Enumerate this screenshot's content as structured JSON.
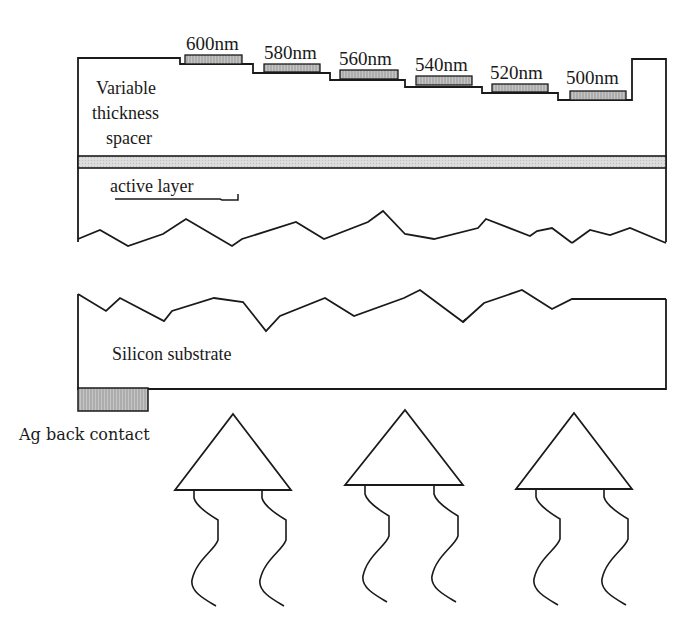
{
  "diagram": {
    "type": "device-cross-section",
    "filters": [
      {
        "label": "600nm"
      },
      {
        "label": "580nm"
      },
      {
        "label": "560nm"
      },
      {
        "label": "540nm"
      },
      {
        "label": "520nm"
      },
      {
        "label": "500nm"
      }
    ],
    "labels": {
      "spacer_line1": "Variable",
      "spacer_line2": "thickness",
      "spacer_line3": "spacer",
      "active_layer": "active layer",
      "substrate": "Silicon substrate",
      "back_contact": "Ag back contact"
    },
    "elements": {
      "light_sources": 3,
      "colors": {
        "outline": "#1a1a1a",
        "filter_fill": "#b8b8b8",
        "band_fill": "#d6d6d6",
        "contact_fill": "#bdbdbd"
      }
    }
  }
}
